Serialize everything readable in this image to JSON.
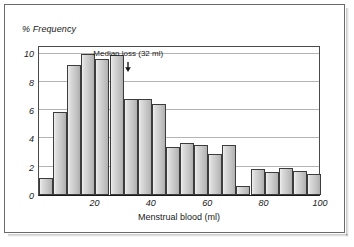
{
  "figure": {
    "frame_color": "#6b6b6b",
    "axis_color": "#1a1a1a",
    "gridline_color": "#b4b4b4",
    "bar_fill": "#cacaca",
    "bar_edge": "#3c3c3c"
  },
  "chart_data": {
    "type": "bar",
    "title": "",
    "subtitle": "",
    "xlabel": "Menstrual blood (ml)",
    "ylabel": "% Frequency",
    "xlim": [
      0,
      100
    ],
    "ylim": [
      0,
      10.6
    ],
    "grid": true,
    "legend": null,
    "bin_width": 5,
    "x_ticks": [
      20,
      40,
      60,
      80,
      100
    ],
    "x_tick_labels": [
      "20",
      "40",
      "60",
      "80",
      "100"
    ],
    "y_ticks": [
      0,
      2,
      4,
      6,
      8,
      10
    ],
    "y_tick_labels": [
      "0",
      "2",
      "4",
      "6",
      "8",
      "10"
    ],
    "categories": [
      "0-5",
      "5-10",
      "10-15",
      "15-20",
      "20-25",
      "25-30",
      "30-35",
      "35-40",
      "40-45",
      "45-50",
      "50-55",
      "55-60",
      "60-65",
      "65-70",
      "70-75",
      "75-80",
      "80-85",
      "85-90",
      "90-95",
      "95-100"
    ],
    "bin_starts": [
      0,
      5,
      10,
      15,
      20,
      25,
      30,
      35,
      40,
      45,
      50,
      55,
      60,
      65,
      70,
      75,
      80,
      85,
      90,
      95
    ],
    "values": [
      1.2,
      5.9,
      9.2,
      10.0,
      9.6,
      9.9,
      6.8,
      6.8,
      6.4,
      3.4,
      3.7,
      3.5,
      2.9,
      3.5,
      0.65,
      1.85,
      1.6,
      1.9,
      1.7,
      1.45
    ],
    "annotations": [
      {
        "name": "median-annotation",
        "label": "Median loss (32 ml)",
        "x": 32,
        "arrow": true
      }
    ]
  }
}
